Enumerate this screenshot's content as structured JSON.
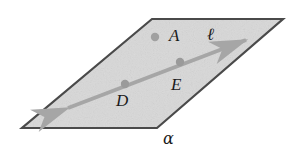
{
  "figure": {
    "kind": "geometry-diagram",
    "background_color": "#ffffff",
    "plane": {
      "name": "plane-alpha",
      "label": "α",
      "fill_color": "#d8d8d8",
      "stroke_color": "#4a4a4a",
      "stroke_width": 2.2,
      "corners": [
        {
          "x": 152,
          "y": 19
        },
        {
          "x": 283,
          "y": 19
        },
        {
          "x": 157,
          "y": 128
        },
        {
          "x": 22,
          "y": 128
        }
      ],
      "label_position": {
        "x": 163,
        "y": 131
      }
    },
    "line": {
      "name": "line-l",
      "label": "ℓ",
      "color": "#a6a6a6",
      "stroke_width": 4,
      "start": {
        "x": 68,
        "y": 108
      },
      "end": {
        "x": 246,
        "y": 40
      },
      "arrowheads": "both",
      "label_position": {
        "x": 207,
        "y": 26
      }
    },
    "points": [
      {
        "name": "point-a",
        "label": "A",
        "dot": {
          "x": 155,
          "y": 37
        },
        "radius": 4.2,
        "color": "#a0a0a0",
        "on_line": false,
        "label_position": {
          "x": 169,
          "y": 27
        }
      },
      {
        "name": "point-e",
        "label": "E",
        "dot": {
          "x": 180,
          "y": 62
        },
        "radius": 4.2,
        "color": "#9a9a9a",
        "on_line": true,
        "label_position": {
          "x": 171,
          "y": 76
        }
      },
      {
        "name": "point-d",
        "label": "D",
        "dot": {
          "x": 125,
          "y": 84
        },
        "radius": 4.2,
        "color": "#9a9a9a",
        "on_line": true,
        "label_position": {
          "x": 116,
          "y": 92
        }
      }
    ]
  }
}
